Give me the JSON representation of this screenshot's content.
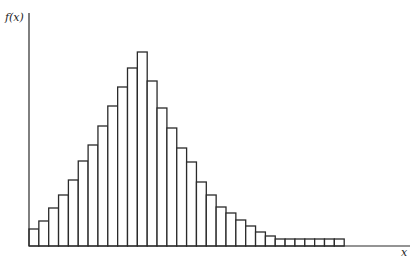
{
  "chart_data": {
    "type": "bar",
    "title": "",
    "xlabel": "x",
    "ylabel": "f(x)",
    "grid": false,
    "legend": null,
    "bar_style": "outlined histogram, no gaps",
    "categories": [
      1,
      2,
      3,
      4,
      5,
      6,
      7,
      8,
      9,
      10,
      11,
      12,
      13,
      14,
      15,
      16,
      17,
      18,
      19,
      20,
      21,
      22,
      23,
      24,
      25,
      26,
      27,
      28,
      29,
      30,
      31,
      32
    ],
    "values": [
      17,
      25,
      38,
      51,
      66,
      85,
      101,
      120,
      140,
      159,
      178,
      194,
      165,
      138,
      118,
      98,
      84,
      64,
      51,
      39,
      33,
      26,
      20,
      14,
      10,
      7,
      7,
      7,
      7,
      7,
      7,
      7
    ],
    "value_units": "relative height (pixels above baseline); no numeric ticks shown",
    "ylim": [
      0,
      233
    ]
  },
  "labels": {
    "y_axis": "f(x)",
    "x_axis": "x"
  },
  "colors": {
    "stroke": "#2a2a2a",
    "fill": "#ffffff",
    "background": "#ffffff"
  }
}
